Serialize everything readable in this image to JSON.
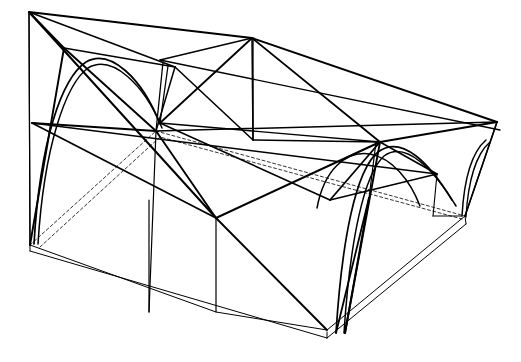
{
  "drawing": {
    "title": "Structural Frame Perspective Wireframe",
    "description": "Axonometric line drawing of a single-storey hall structure: rectangular floor slab with edge thickness, four perimeter portal frames with parabolic arched ribs, inclined corner posts, roof truss with triangulated web members and diagonal cross-bracing.",
    "view": "one-point-oblique perspective, viewed from above-left",
    "background_color": "#ffffff",
    "line_color": "#000000",
    "hidden_line_color": "#808080",
    "canvas": {
      "width": 521,
      "height": 362
    },
    "line_weights": {
      "heavy": 2.1,
      "medium": 1.5,
      "light": 1.0,
      "thin": 0.8,
      "hidden": 0.8
    },
    "hidden_line_dash": "3 2.5",
    "layers": [
      {
        "name": "floor-slab",
        "label": "Floor slab"
      },
      {
        "name": "hidden-edges",
        "label": "Hidden slab edges"
      },
      {
        "name": "arch-ribs",
        "label": "Parabolic arch ribs"
      },
      {
        "name": "columns",
        "label": "Columns and posts"
      },
      {
        "name": "roof-truss",
        "label": "Roof truss members"
      },
      {
        "name": "bracing",
        "label": "Diagonal cross bracing"
      }
    ]
  },
  "geometry": {
    "slab": {
      "name": "floor-slab",
      "top_face": "M 30,245 L 216,312 L 327,330 L 465,216 Z",
      "top_face_outline": "M 30,245 L 216,312 L 327,330 L 465,216",
      "front_left_edge_top": "M 30,245 L 327,332",
      "front_left_edge_bottom": "M 30,251 L 327,338",
      "front_right_edge_top": "M 327,332 L 466,219",
      "front_right_edge_bottom": "M 327,338 L 466,224",
      "left_end_cap": "M 30,245 L 30,251",
      "right_end_cap": "M 465,216 L 466,224",
      "front_corner_cap": "M 327,332 L 327,338",
      "back_left_hidden": "M 30,245 L 156,131",
      "back_right_hidden": "M 156,131 L 465,216",
      "hidden_inner": "M 40,247 L 160,137 L 462,219"
    },
    "roof_beams": {
      "back_top_left": "M 29,12 L 252,38",
      "back_top_right": "M 252,38 L 497,122",
      "left_edge_post": "M 29,12 L 30,245",
      "right_edge_post": "M 497,122 L 465,216",
      "left_ridge": "M 29,12 L 175,67",
      "mid_purlin_upper": "M 156,131 L 497,122",
      "mid_purlin_lower": "M 32,123 L 437,174",
      "eave_line": "M 160,60 L 500,130"
    },
    "truss_nodes": [
      {
        "id": "n-top-left",
        "x": 29,
        "y": 12
      },
      {
        "id": "n-apex",
        "x": 252,
        "y": 38
      },
      {
        "id": "n-top-right",
        "x": 497,
        "y": 122
      },
      {
        "id": "n-left-knee",
        "x": 64,
        "y": 48
      },
      {
        "id": "n-mid-left",
        "x": 156,
        "y": 131
      },
      {
        "id": "n-mid-right",
        "x": 380,
        "y": 142
      },
      {
        "id": "n-base-left",
        "x": 30,
        "y": 245
      },
      {
        "id": "n-base-front",
        "x": 327,
        "y": 330
      },
      {
        "id": "n-base-right",
        "x": 465,
        "y": 216
      },
      {
        "id": "n-center-floor",
        "x": 216,
        "y": 312
      }
    ],
    "members": {
      "truss_web": [
        "M 29,12 L 64,48",
        "M 64,48 L 175,67",
        "M 64,48 L 156,131",
        "M 175,67 L 156,131",
        "M 252,38 L 160,123",
        "M 252,38 L 253,140",
        "M 252,38 L 380,142",
        "M 160,123 L 380,142",
        "M 380,142 L 497,122",
        "M 380,142 L 437,174",
        "M 160,60 L 252,38"
      ],
      "bracing": [
        "M 29,12 L 216,218",
        "M 64,48 L 30,245",
        "M 32,123 L 156,131",
        "M 32,123 L 216,218",
        "M 216,218 L 156,131",
        "M 216,218 L 327,330",
        "M 216,218 L 380,142",
        "M 253,140 L 380,142",
        "M 175,67 L 253,140",
        "M 380,142 L 345,333",
        "M 380,142 L 330,200",
        "M 330,200 L 437,174",
        "M 160,123 L 330,200"
      ],
      "columns": [
        "M 156,131 L 149,312",
        "M 168,66 L 160,123",
        "M 163,62 L 156,131",
        "M 253,140 L 253,40",
        "M 376,142 L 369,198",
        "M 437,174 L 433,216",
        "M 497,122 L 465,216",
        "M 29,12 L 30,245"
      ],
      "arch_ribs": [
        "M 34,244 C 40,140 62,78 86,62 C 110,48 142,78 160,124",
        "M 38,244 C 44,146 66,84 88,68 C 112,54 144,84 162,128",
        "M 336,333 C 342,238 356,170 378,152 C 402,134 430,164 452,200",
        "M 344,333 C 350,240 364,174 384,156 C 406,140 434,170 456,206",
        "M 317,208 C 324,170 346,150 370,154 C 392,158 410,180 420,206",
        "M 462,216 C 464,180 472,152 486,140",
        "M 466,217 C 468,182 476,154 490,142"
      ],
      "posts_to_floor": [
        "M 149,312 L 149,200",
        "M 216,312 L 216,218",
        "M 369,198 L 345,333",
        "M 369,198 L 336,333",
        "M 433,216 L 462,216"
      ]
    }
  }
}
